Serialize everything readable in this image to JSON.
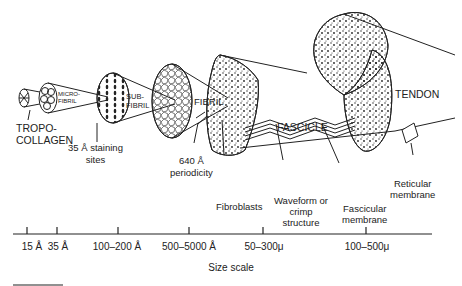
{
  "diagram": {
    "structures": [
      {
        "id": "tropocollagen",
        "label_line1": "TROPO-",
        "label_line2": "COLLAGEN"
      },
      {
        "id": "microfibril",
        "label_line1": "MICRO-",
        "label_line2": "FIBRIL"
      },
      {
        "id": "subfibril",
        "label_line1": "SUB-",
        "label_line2": "FIBRIL"
      },
      {
        "id": "fibril",
        "label": "FIBRIL"
      },
      {
        "id": "fascicle",
        "label": "FASCICLE"
      },
      {
        "id": "tendon",
        "label": "TENDON"
      }
    ],
    "annotations": {
      "staining_line1": "35 Å staining",
      "staining_line2": "sites",
      "periodicity_line1": "640 Å",
      "periodicity_line2": "periodicity",
      "fibroblasts": "Fibroblasts",
      "waveform_line1": "Waveform or",
      "waveform_line2": "crimp",
      "waveform_line3": "structure",
      "fascicular_line1": "Fascicular",
      "fascicular_line2": "membrane",
      "reticular_line1": "Reticular",
      "reticular_line2": "membrane"
    },
    "scale": {
      "title": "Size scale",
      "ticks": [
        "15 Å",
        "35 Å",
        "100–200 Å",
        "500–5000 Å",
        "50–300μ",
        "100–500μ"
      ]
    }
  }
}
